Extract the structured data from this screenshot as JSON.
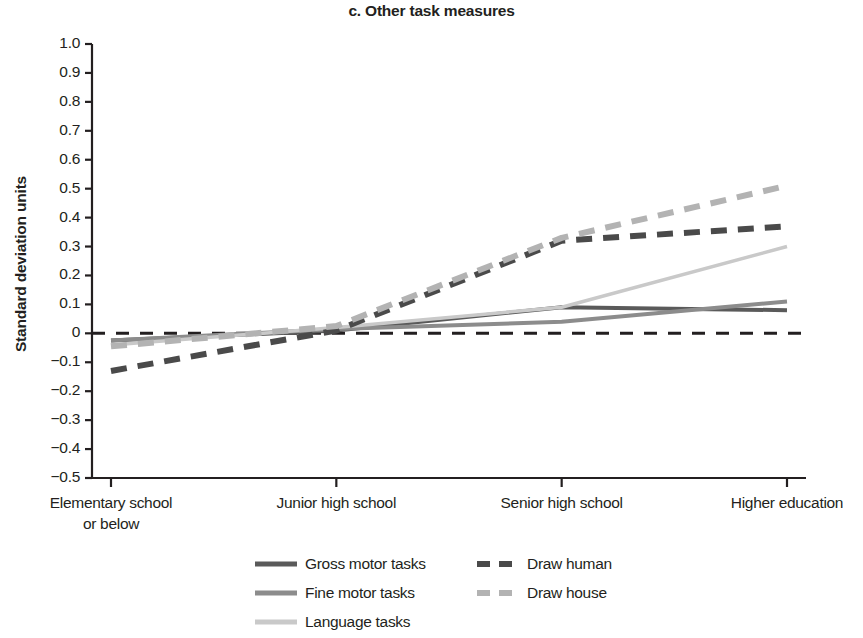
{
  "chart_data": {
    "type": "line",
    "title": "c. Other task measures",
    "xlabel": "",
    "ylabel": "Standard deviation units",
    "categories": [
      "Elementary school\nor below",
      "Junior high school",
      "Senior high school",
      "Higher education"
    ],
    "category_lines": [
      [
        "Elementary school",
        "or below"
      ],
      [
        "Junior high school"
      ],
      [
        "Senior high school"
      ],
      [
        "Higher education"
      ]
    ],
    "ylim": [
      -0.5,
      1.0
    ],
    "ytick_labels": [
      "1.0",
      "0.9",
      "0.8",
      "0.7",
      "0.6",
      "0.5",
      "0.4",
      "0.3",
      "0.2",
      "0.1",
      "0",
      "−0.1",
      "−0.2",
      "−0.3",
      "−0.4",
      "−0.5"
    ],
    "ytick_values": [
      1.0,
      0.9,
      0.8,
      0.7,
      0.6,
      0.5,
      0.4,
      0.3,
      0.2,
      0.1,
      0,
      -0.1,
      -0.2,
      -0.3,
      -0.4,
      -0.5
    ],
    "grid": false,
    "zero_reference_line": {
      "value": 0,
      "style": "dashed",
      "color": "#231f20"
    },
    "legend_position": "below",
    "series": [
      {
        "name": "Gross motor tasks",
        "values": [
          -0.025,
          0.01,
          0.09,
          0.08
        ],
        "style": "solid",
        "color": "#5a5a5a",
        "width": 4
      },
      {
        "name": "Fine motor tasks",
        "values": [
          -0.025,
          0.015,
          0.04,
          0.11
        ],
        "style": "solid",
        "color": "#8c8c8c",
        "width": 4
      },
      {
        "name": "Language tasks",
        "values": [
          -0.04,
          0.02,
          0.09,
          0.3
        ],
        "style": "solid",
        "color": "#c9c9c9",
        "width": 3.5
      },
      {
        "name": "Draw human",
        "values": [
          -0.13,
          0.01,
          0.32,
          0.37
        ],
        "style": "dashed",
        "color": "#4a4a4a",
        "width": 6
      },
      {
        "name": "Draw house",
        "values": [
          -0.045,
          0.025,
          0.33,
          0.51
        ],
        "style": "dashed",
        "color": "#b3b3b3",
        "width": 6
      }
    ]
  },
  "legend": {
    "items": [
      {
        "label": "Gross motor tasks",
        "color": "#5a5a5a",
        "style": "solid"
      },
      {
        "label": "Fine motor tasks",
        "color": "#8c8c8c",
        "style": "solid"
      },
      {
        "label": "Language tasks",
        "color": "#c9c9c9",
        "style": "solid"
      },
      {
        "label": "Draw human",
        "color": "#4a4a4a",
        "style": "dashed"
      },
      {
        "label": "Draw house",
        "color": "#b3b3b3",
        "style": "dashed"
      }
    ]
  },
  "axis_colors": {
    "axis": "#231f20",
    "text": "#231f20"
  }
}
